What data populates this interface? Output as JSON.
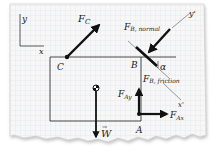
{
  "diagram": {
    "colors": {
      "paper": "#f7f7f7",
      "grid": "#d6dbe0",
      "ink": "#111111",
      "outline": "#333333"
    },
    "axes": {
      "y_label": "y",
      "x_label": "x"
    },
    "rotated_axes": {
      "y_label": "y'",
      "x_label": "x'"
    },
    "points": {
      "C": "C",
      "B": "B",
      "A": "A"
    },
    "angle_label": "α",
    "forces": {
      "F_C": {
        "main": "F",
        "sub": "C"
      },
      "F_B_normal": {
        "main": "F",
        "sub": "B, normal"
      },
      "F_B_friction": {
        "main": "F",
        "sub": "B, friction"
      },
      "F_Ay": {
        "main": "F",
        "sub": "Ay"
      },
      "F_Ax": {
        "main": "F",
        "sub": "Ax"
      },
      "W": {
        "main": "W",
        "vector_mark": "→"
      }
    }
  }
}
